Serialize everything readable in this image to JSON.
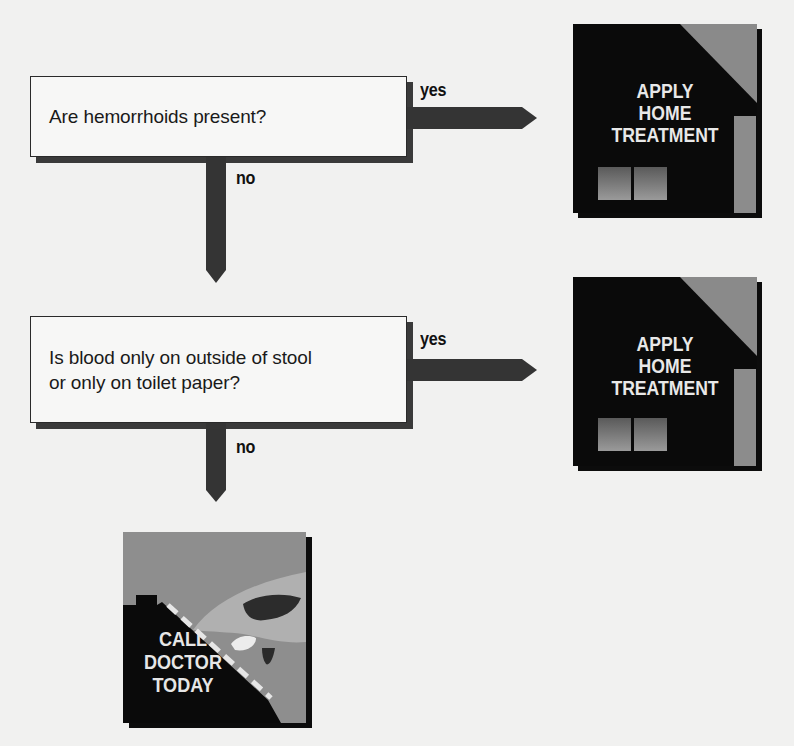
{
  "flowchart": {
    "questions": [
      {
        "id": "q1",
        "text": "Are hemorrhoids present?"
      },
      {
        "id": "q2",
        "line1": "Is blood only on outside of stool",
        "line2": "or only on toilet paper?"
      }
    ],
    "branches": {
      "q1_yes": "yes",
      "q1_no": "no",
      "q2_yes": "yes",
      "q2_no": "no"
    },
    "outcomes": {
      "home_treatment_1": {
        "line1": "APPLY",
        "line2": "HOME",
        "line3": "TREATMENT",
        "icon": "house-icon"
      },
      "home_treatment_2": {
        "line1": "APPLY",
        "line2": "HOME",
        "line3": "TREATMENT",
        "icon": "house-icon"
      },
      "call_doctor": {
        "line1": "CALL",
        "line2": "DOCTOR",
        "line3": "TODAY",
        "icon": "hand-dialing-phone-icon"
      }
    }
  },
  "colors": {
    "background": "#f1f1f0",
    "box_fill": "#f7f7f6",
    "arrow": "#333333",
    "panel_black": "#0a0a0a",
    "panel_gray": "#8e8e8e",
    "caption_text": "#e8e8e8"
  }
}
